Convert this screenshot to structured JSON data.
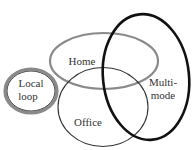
{
  "diagram": {
    "type": "venn",
    "sets": [
      {
        "id": "local-loop",
        "label_lines": [
          "Local",
          "loop"
        ],
        "stroke": "#555555",
        "style": "double"
      },
      {
        "id": "home",
        "label_lines": [
          "Home"
        ],
        "stroke": "#8a8a8a",
        "style": "thick-gray"
      },
      {
        "id": "office",
        "label_lines": [
          "Office"
        ],
        "stroke": "#333333",
        "style": "thin"
      },
      {
        "id": "multi-mode",
        "label_lines": [
          "Multi-",
          "mode"
        ],
        "stroke": "#111111",
        "style": "thick-black"
      }
    ]
  },
  "labels": {
    "local_1": "Local",
    "local_2": "loop",
    "home": "Home",
    "office": "Office",
    "multi_1": "Multi-",
    "multi_2": "mode"
  }
}
